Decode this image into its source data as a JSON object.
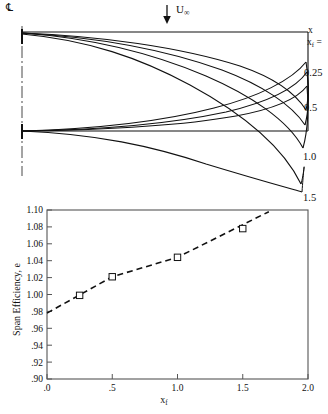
{
  "figure": {
    "panels": [
      "wing-planform-diagram",
      "span-efficiency-chart"
    ]
  },
  "planform": {
    "centerline_symbol": "℄",
    "flow_arrow_label_base": "U",
    "flow_arrow_label_sub": "∞",
    "flow_arrow_icon": "down-arrow-icon",
    "axis_label_x": "x",
    "parameter_label_base": "x",
    "parameter_label_sub": "f",
    "parameter_label_eq": " =",
    "curve_labels": [
      "0.25",
      "0.5",
      "1.0",
      "1.5"
    ],
    "curve_label_top": "",
    "series_values": [
      0,
      0.25,
      0.5,
      1.0,
      1.5
    ],
    "line_color": "#111111",
    "centerline_color": "#333333"
  },
  "chart_data": {
    "type": "line",
    "title": "",
    "xlabel": "x_f",
    "xlabel_base": "x",
    "xlabel_sub": "f",
    "ylabel": "Span Efficiency, e",
    "x": [
      0.25,
      0.5,
      1.0,
      1.5
    ],
    "values": [
      0.999,
      1.021,
      1.044,
      1.078
    ],
    "series": [
      {
        "name": "Span Efficiency",
        "x": [
          0.25,
          0.5,
          1.0,
          1.5
        ],
        "values": [
          0.999,
          1.021,
          1.044,
          1.078
        ],
        "marker": "square-open",
        "linestyle": "dashed"
      },
      {
        "name": "trend",
        "x": [
          0.0,
          0.5,
          1.0,
          1.7
        ],
        "values": [
          0.978,
          1.021,
          1.044,
          1.098
        ],
        "marker": "none",
        "linestyle": "dashed"
      }
    ],
    "xlim": [
      0.0,
      2.0
    ],
    "ylim": [
      0.9,
      1.1
    ],
    "xticks": [
      0.0,
      0.5,
      1.0,
      1.5,
      2.0
    ],
    "xticklabels": [
      ".0",
      ".5",
      "1.0",
      "1.5",
      "2.0"
    ],
    "yticks": [
      0.9,
      0.92,
      0.94,
      0.96,
      0.98,
      1.0,
      1.02,
      1.04,
      1.06,
      1.08,
      1.1
    ],
    "yticklabels": [
      ".90",
      ".92",
      ".94",
      ".96",
      ".98",
      "1.00",
      "1.02",
      "1.04",
      "1.06",
      "1.08",
      "1.10"
    ],
    "grid": false,
    "legend": "none",
    "line_color": "#111111",
    "frame_color": "#555555"
  }
}
